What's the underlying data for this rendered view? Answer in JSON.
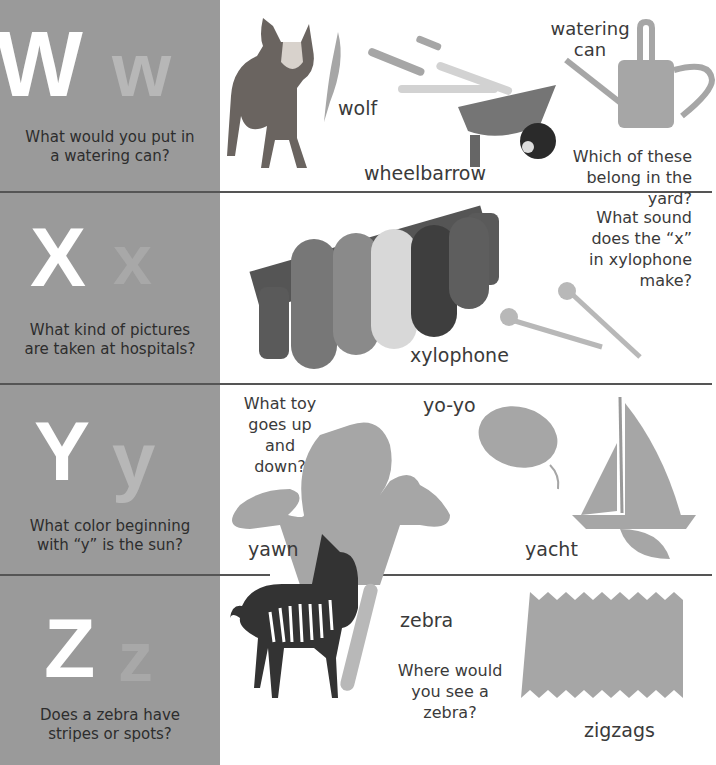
{
  "sections": [
    {
      "letter_upper": "W",
      "letter_lower": "w",
      "question": "What would you put in a watering can?",
      "question_lines": [
        "What would you put in",
        "a watering can?"
      ],
      "labels": {
        "wolf": "wolf",
        "wheelbarrow": "wheelbarrow",
        "watering_can_1": "watering",
        "watering_can_2": "can"
      },
      "side_question_lines": [
        "Which of these",
        "belong in the yard?"
      ]
    },
    {
      "letter_upper": "X",
      "letter_lower": "x",
      "question_lines": [
        "What kind of pictures",
        "are taken at hospitals?"
      ],
      "labels": {
        "xylophone": "xylophone"
      },
      "side_question_lines": [
        "What sound",
        "does the “x”",
        "in xylophone",
        "make?"
      ]
    },
    {
      "letter_upper": "Y",
      "letter_lower": "y",
      "question_lines": [
        "What color beginning",
        "with “y” is the sun?"
      ],
      "labels": {
        "yoyo": "yo-yo",
        "yawn": "yawn",
        "yacht": "yacht"
      },
      "side_question_lines": [
        "What toy",
        "goes up",
        "and down?"
      ]
    },
    {
      "letter_upper": "Z",
      "letter_lower": "z",
      "question_lines": [
        "Does a zebra have",
        "stripes or spots?"
      ],
      "labels": {
        "zebra": "zebra",
        "zigzags": "zigzags"
      },
      "side_question_lines": [
        "Where would",
        "you see a",
        "zebra?"
      ]
    }
  ],
  "colors": {
    "left_panel": "#9a9a9a",
    "letter_upper": "#ffffff",
    "letter_lower": "#b7b7b7",
    "silhouette": "#a6a6a6",
    "divider": "#555555"
  }
}
